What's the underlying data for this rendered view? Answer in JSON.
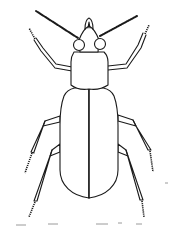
{
  "image": {
    "subject": "beetle line drawing, dorsal view",
    "background_color": "#ffffff",
    "line_color": "#1a1a1a",
    "parts": [
      "antennae",
      "mandibles",
      "head",
      "eyes",
      "pronotum",
      "elytra",
      "front legs",
      "middle legs",
      "hind legs"
    ]
  }
}
